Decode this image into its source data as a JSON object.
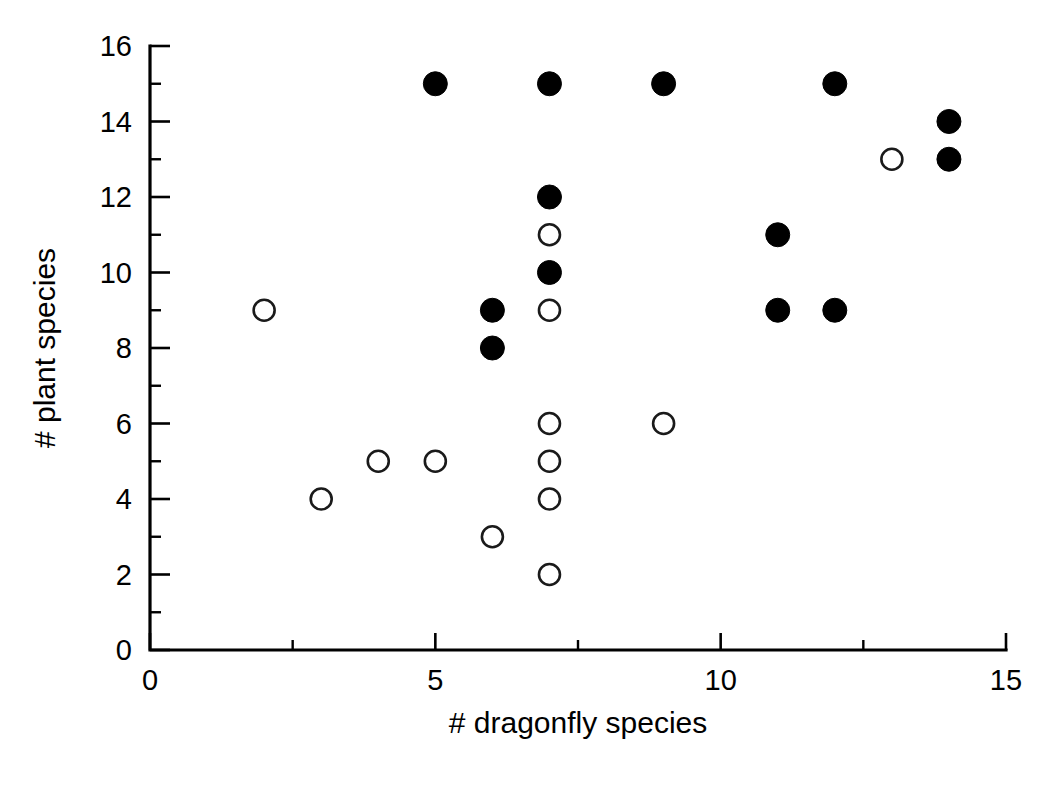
{
  "chart_data": {
    "type": "scatter",
    "title": "",
    "xlabel": "# dragonfly species",
    "ylabel": "# plant species",
    "xlim": [
      0,
      15
    ],
    "ylim": [
      0,
      16
    ],
    "xticks": [
      0,
      5,
      10,
      15
    ],
    "yticks": [
      0,
      2,
      4,
      6,
      8,
      10,
      12,
      14,
      16
    ],
    "xtick_labels": [
      "0",
      "5",
      "10",
      "15"
    ],
    "ytick_labels": [
      "0",
      "2",
      "4",
      "6",
      "8",
      "10",
      "12",
      "14",
      "16"
    ],
    "x_minor_tick_interval": 2.5,
    "y_minor_tick_interval": 1,
    "grid": false,
    "legend": false,
    "legend_position": "none",
    "series": [
      {
        "name": "filled-circles",
        "marker": "filled-circle",
        "color": "#000000",
        "points": [
          {
            "x": 5,
            "y": 15
          },
          {
            "x": 7,
            "y": 15
          },
          {
            "x": 9,
            "y": 15
          },
          {
            "x": 12,
            "y": 15
          },
          {
            "x": 14,
            "y": 14
          },
          {
            "x": 14,
            "y": 13
          },
          {
            "x": 7,
            "y": 12
          },
          {
            "x": 11,
            "y": 11
          },
          {
            "x": 7,
            "y": 10
          },
          {
            "x": 6,
            "y": 9
          },
          {
            "x": 11,
            "y": 9
          },
          {
            "x": 12,
            "y": 9
          },
          {
            "x": 6,
            "y": 8
          }
        ]
      },
      {
        "name": "open-circles",
        "marker": "open-circle",
        "color": "#ffffff",
        "edge_color": "#1a1a1a",
        "points": [
          {
            "x": 13,
            "y": 13
          },
          {
            "x": 7,
            "y": 11
          },
          {
            "x": 2,
            "y": 9
          },
          {
            "x": 7,
            "y": 9
          },
          {
            "x": 7,
            "y": 6
          },
          {
            "x": 9,
            "y": 6
          },
          {
            "x": 4,
            "y": 5
          },
          {
            "x": 5,
            "y": 5
          },
          {
            "x": 7,
            "y": 5
          },
          {
            "x": 3,
            "y": 4
          },
          {
            "x": 7,
            "y": 4
          },
          {
            "x": 6,
            "y": 3
          },
          {
            "x": 7,
            "y": 2
          }
        ]
      }
    ]
  },
  "axes": {
    "x_title": "# dragonfly species",
    "y_title": "# plant species"
  }
}
